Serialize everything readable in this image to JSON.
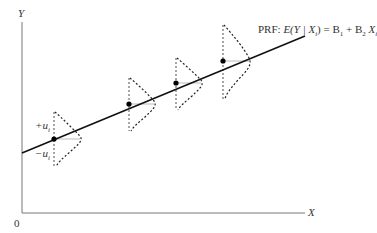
{
  "diagram": {
    "y_axis_label": "Y",
    "x_axis_label": "X",
    "origin_label": "0",
    "prf_label": {
      "prefix": "PRF: ",
      "lhs": "E(Y | X",
      "lhs_sub": "i",
      "lhs_close": ")",
      "eq": " = B",
      "b1_sub": "1",
      "plus": " + B",
      "b2_sub": "2",
      "x": " X",
      "x_sub": "i"
    },
    "plus_u_label": "+u",
    "plus_u_sub": "i",
    "minus_u_label": "−u",
    "minus_u_sub": "i",
    "points": [
      {
        "x": 54,
        "y": 139
      },
      {
        "x": 129,
        "y": 104
      },
      {
        "x": 176,
        "y": 83
      },
      {
        "x": 223,
        "y": 61
      }
    ],
    "line": {
      "x1": 22,
      "y1": 153,
      "x2": 305,
      "y2": 36
    },
    "colors": {
      "axis": "#666666",
      "line": "#111111",
      "dashed": "#222222",
      "guide": "#aaaaaa"
    }
  }
}
